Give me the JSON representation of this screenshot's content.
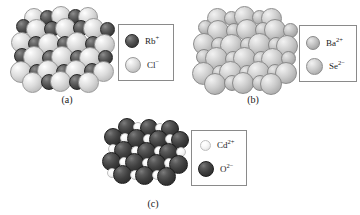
{
  "figure": {
    "type": "ionic-crystal-structure-diagram",
    "background_color": "#ffffff",
    "panel_count": 3
  },
  "panels": [
    {
      "id": "a",
      "caption": "(a)",
      "compound": "RbCl",
      "lattice_type": "rock-salt",
      "legend": {
        "entries": [
          {
            "symbol": "Rb",
            "charge": "+",
            "label": "Rb",
            "sphere_style": "dark",
            "sphere_color": "#4a4a4a",
            "relative_size": "small"
          },
          {
            "symbol": "Cl",
            "charge": "−",
            "label": "Cl",
            "sphere_style": "light",
            "sphere_color": "#d8d8d8",
            "relative_size": "large"
          }
        ]
      }
    },
    {
      "id": "b",
      "caption": "(b)",
      "compound": "BaSe",
      "lattice_type": "rock-salt",
      "legend": {
        "entries": [
          {
            "symbol": "Ba",
            "charge": "2+",
            "label": "Ba",
            "sphere_style": "midsmall",
            "sphere_color": "#bdbdbd",
            "relative_size": "small"
          },
          {
            "symbol": "Se",
            "charge": "2−",
            "label": "Se",
            "sphere_style": "mid",
            "sphere_color": "#cfcfcf",
            "relative_size": "large"
          }
        ]
      }
    },
    {
      "id": "c",
      "caption": "(c)",
      "compound": "CdO",
      "lattice_type": "rock-salt",
      "legend": {
        "entries": [
          {
            "symbol": "Cd",
            "charge": "2+",
            "label": "Cd",
            "sphere_style": "white",
            "sphere_color": "#f5f5f5",
            "relative_size": "small"
          },
          {
            "symbol": "O",
            "charge": "2−",
            "label": "O",
            "sphere_style": "vdark",
            "sphere_color": "#3a3a3a",
            "relative_size": "large"
          }
        ]
      }
    }
  ]
}
